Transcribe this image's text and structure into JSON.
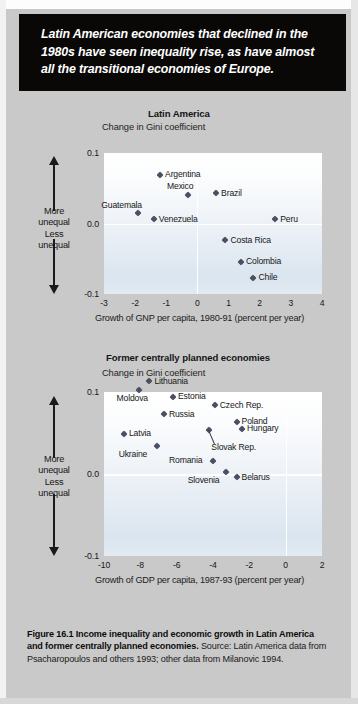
{
  "banner": {
    "text": "Latin American economies that declined in the 1980s have seen inequality rise, as have almost all the transitional economies of Europe."
  },
  "axis_direction": {
    "more_label": "More\nunequal",
    "less_label": "Less\nunequal",
    "more": "More unequal",
    "less": "Less unequal"
  },
  "caption": {
    "bold": "Figure 16.1  Income inequality and economic growth in Latin America and former centrally planned economies.",
    "rest": " Source: Latin America data from Psacharopoulos and others 1993; other data from Milanovic 1994."
  },
  "colors": {
    "banner_bg": "#090807",
    "page_bg": "#c9c9c9",
    "marker": "#4a4f63",
    "gridline": "#ffffff"
  },
  "chart_data": [
    {
      "type": "scatter",
      "title": "Latin America",
      "ylabel": "Change in Gini coefficient",
      "xlabel": "Growth of GNP per capita, 1980-91 (percent per year)",
      "xlim": [
        -3,
        4
      ],
      "ylim": [
        -0.1,
        0.1
      ],
      "xticks": [
        "-3",
        "-2",
        "-1",
        "0",
        "1",
        "2",
        "3",
        "4"
      ],
      "xtick_values": [
        -3,
        -2,
        -1,
        0,
        1,
        2,
        3,
        4
      ],
      "yticks": [
        "0.1",
        "0.0",
        "-0.1"
      ],
      "ytick_values": [
        0.1,
        0.0,
        -0.1
      ],
      "grid": true,
      "points": [
        {
          "name": "Argentina",
          "x": -1.2,
          "y": 0.069,
          "label_pos": "right"
        },
        {
          "name": "Mexico",
          "x": -0.3,
          "y": 0.04,
          "label_pos": "above"
        },
        {
          "name": "Brazil",
          "x": 0.6,
          "y": 0.043,
          "label_pos": "right"
        },
        {
          "name": "Guatemala",
          "x": -1.9,
          "y": 0.015,
          "label_pos": "above-left"
        },
        {
          "name": "Venezuela",
          "x": -1.4,
          "y": 0.006,
          "label_pos": "right"
        },
        {
          "name": "Peru",
          "x": 2.5,
          "y": 0.006,
          "label_pos": "right"
        },
        {
          "name": "Costa Rica",
          "x": 0.9,
          "y": -0.024,
          "label_pos": "right"
        },
        {
          "name": "Colombia",
          "x": 1.4,
          "y": -0.054,
          "label_pos": "right"
        },
        {
          "name": "Chile",
          "x": 1.8,
          "y": -0.077,
          "label_pos": "right"
        }
      ]
    },
    {
      "type": "scatter",
      "title": "Former centrally planned economies",
      "ylabel": "Change in Gini coefficient",
      "xlabel": "Growth of GDP per capita, 1987-93 (percent per year)",
      "xlim": [
        -10,
        2
      ],
      "ylim": [
        -0.1,
        0.1
      ],
      "xticks": [
        "-10",
        "-8",
        "-6",
        "-4",
        "-2",
        "0",
        "2"
      ],
      "xtick_values": [
        -10,
        -8,
        -6,
        -4,
        -2,
        0,
        2
      ],
      "yticks": [
        "0.1",
        "0.0",
        "-0.1"
      ],
      "ytick_values": [
        0.1,
        0.0,
        -0.1
      ],
      "grid": true,
      "points": [
        {
          "name": "Lithuania",
          "x": -7.5,
          "y": 0.113,
          "label_pos": "right"
        },
        {
          "name": "Moldova",
          "x": -8.1,
          "y": 0.102,
          "label_pos": "below"
        },
        {
          "name": "Estonia",
          "x": -6.2,
          "y": 0.094,
          "label_pos": "right"
        },
        {
          "name": "Czech Rep.",
          "x": -3.9,
          "y": 0.084,
          "label_pos": "right"
        },
        {
          "name": "Russia",
          "x": -6.7,
          "y": 0.073,
          "label_pos": "right"
        },
        {
          "name": "Poland",
          "x": -2.7,
          "y": 0.064,
          "label_pos": "right"
        },
        {
          "name": "Hungary",
          "x": -2.4,
          "y": 0.055,
          "label_pos": "right"
        },
        {
          "name": "Latvia",
          "x": -8.9,
          "y": 0.049,
          "label_pos": "right"
        },
        {
          "name": "Slovak Rep.",
          "x": -4.2,
          "y": 0.054,
          "label_pos": "leader"
        },
        {
          "name": "Ukraine",
          "x": -7.1,
          "y": 0.034,
          "label_pos": "below-left"
        },
        {
          "name": "Romania",
          "x": -4.0,
          "y": 0.016,
          "label_pos": "left"
        },
        {
          "name": "Slovenia",
          "x": -3.3,
          "y": 0.002,
          "label_pos": "below-left"
        },
        {
          "name": "Belarus",
          "x": -2.7,
          "y": -0.004,
          "label_pos": "right"
        }
      ]
    }
  ]
}
